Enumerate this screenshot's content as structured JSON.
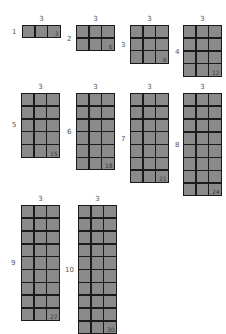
{
  "diagram": {
    "title": "",
    "colors": {
      "cell": "#8a8a8a",
      "grid_line": "#1a1a1a",
      "label": "#555555"
    },
    "arrays": [
      {
        "rows": 1,
        "cols": 3,
        "row_label": "1",
        "col_label": "3",
        "total": "3",
        "x": 22,
        "y": 25,
        "row_label_x": 12,
        "row_label_y": 28
      },
      {
        "rows": 2,
        "cols": 3,
        "row_label": "2",
        "col_label": "3",
        "total": "6",
        "x": 76,
        "y": 25,
        "row_label_x": 67,
        "row_label_y": 35
      },
      {
        "rows": 3,
        "cols": 3,
        "row_label": "3",
        "col_label": "3",
        "total": "9",
        "x": 130,
        "y": 25,
        "row_label_x": 121,
        "row_label_y": 41
      },
      {
        "rows": 4,
        "cols": 3,
        "row_label": "4",
        "col_label": "3",
        "total": "12",
        "x": 183,
        "y": 25,
        "row_label_x": 175,
        "row_label_y": 48
      },
      {
        "rows": 5,
        "cols": 3,
        "row_label": "5",
        "col_label": "3",
        "total": "15",
        "x": 21,
        "y": 93,
        "row_label_x": 12,
        "row_label_y": 121
      },
      {
        "rows": 6,
        "cols": 3,
        "row_label": "6",
        "col_label": "3",
        "total": "18",
        "x": 76,
        "y": 93,
        "row_label_x": 67,
        "row_label_y": 128
      },
      {
        "rows": 7,
        "cols": 3,
        "row_label": "7",
        "col_label": "3",
        "total": "21",
        "x": 130,
        "y": 93,
        "row_label_x": 121,
        "row_label_y": 135
      },
      {
        "rows": 8,
        "cols": 3,
        "row_label": "8",
        "col_label": "3",
        "total": "24",
        "x": 183,
        "y": 93,
        "row_label_x": 175,
        "row_label_y": 141
      },
      {
        "rows": 9,
        "cols": 3,
        "row_label": "9",
        "col_label": "3",
        "total": "27",
        "x": 21,
        "y": 205,
        "row_label_x": 11,
        "row_label_y": 259
      },
      {
        "rows": 10,
        "cols": 3,
        "row_label": "10",
        "col_label": "3",
        "total": "30",
        "x": 78,
        "y": 205,
        "row_label_x": 65,
        "row_label_y": 266
      }
    ]
  }
}
